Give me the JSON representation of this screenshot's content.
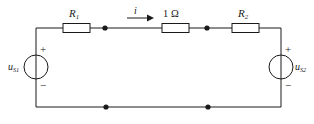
{
  "figure": {
    "type": "electrical-circuit-schematic",
    "background_color": "#ffffff",
    "line_color": "#1a1a1a"
  },
  "components": {
    "resistor_r1": {
      "label": "R",
      "subscript": "1",
      "name": "resistor-r1"
    },
    "resistor_1ohm": {
      "label": "1 Ω",
      "name": "resistor-1-ohm"
    },
    "resistor_r2": {
      "label": "R",
      "subscript": "2",
      "name": "resistor-r2"
    },
    "source_left": {
      "label": "u",
      "subscript": "S1",
      "plus": "+",
      "minus": "−",
      "name": "voltage-source-us1"
    },
    "source_right": {
      "label": "u",
      "subscript": "S2",
      "plus": "+",
      "minus": "−",
      "name": "voltage-source-us2"
    },
    "current": {
      "label": "i",
      "direction": "right",
      "name": "current-arrow-i"
    }
  },
  "nodes": [
    {
      "id": "top-left-node",
      "x": 105,
      "y": 28
    },
    {
      "id": "top-right-node",
      "x": 207,
      "y": 28
    },
    {
      "id": "bottom-left-node",
      "x": 106,
      "y": 107
    },
    {
      "id": "bottom-right-node",
      "x": 208,
      "y": 107
    }
  ]
}
